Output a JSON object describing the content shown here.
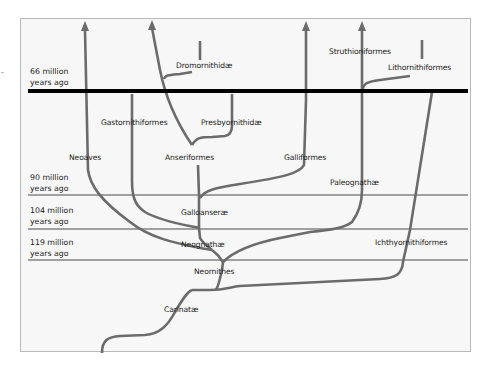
{
  "diagram": {
    "type": "phylogenetic-tree",
    "time_markers": [
      {
        "line1": "66 million",
        "line2": "years ago",
        "style": "thick"
      },
      {
        "line1": "90 million",
        "line2": "years ago",
        "style": "thin"
      },
      {
        "line1": "104 million",
        "line2": "years ago",
        "style": "thin"
      },
      {
        "line1": "119 million",
        "line2": "years ago",
        "style": "thin"
      }
    ],
    "clades": {
      "carinatae": "Carinatæ",
      "neornithes": "Neornithes",
      "neognathae": "Neognathæ",
      "galloanserae": "Galloanseræ",
      "neoaves": "Neoaves",
      "anseriformes": "Anseriformes",
      "galliformes": "Galliformes",
      "gastornithiformes": "Gastornithiformes",
      "presbyornithidae": "Presbyornithidæ",
      "dromornithidae": "Dromornithidæ",
      "paleognathae": "Paleognathæ",
      "struthioniformes": "Struthioniformes",
      "lithornithiformes": "Lithornithiformes",
      "ichthyornithiformes": "Ichthyornithiformes"
    },
    "colors": {
      "branch": "#6b6b6b",
      "boundary_line": "#000000",
      "time_line": "#4a4a4a",
      "background": "#f7f7f7",
      "border": "#b9b9b9"
    }
  }
}
